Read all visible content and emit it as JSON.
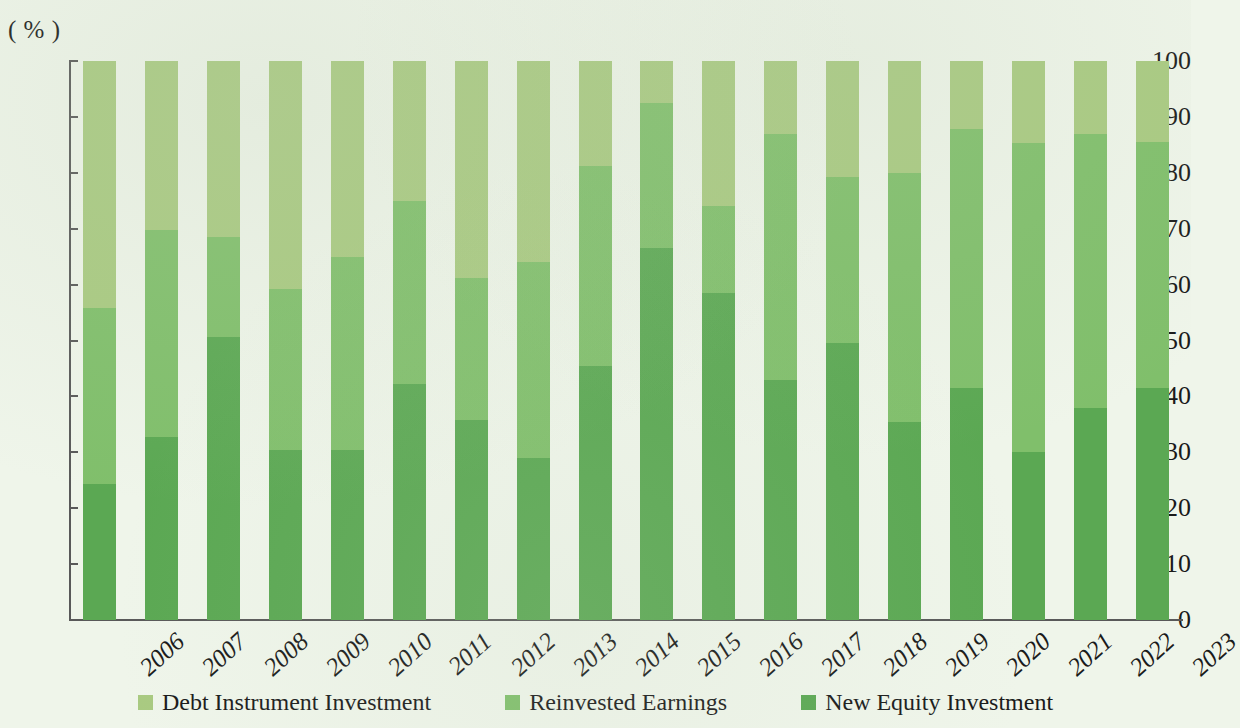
{
  "chart_data": {
    "type": "bar",
    "subtype": "100% stacked column",
    "title": "",
    "xlabel": "",
    "ylabel": "",
    "y_unit_label": "( % )",
    "ylim": [
      0,
      100
    ],
    "y_ticks": [
      0,
      10,
      20,
      30,
      40,
      50,
      60,
      70,
      80,
      90,
      100
    ],
    "grid": false,
    "legend_position": "bottom-center",
    "stack_order_bottom_to_top": [
      "New Equity Investment",
      "Reinvested Earnings",
      "Debt Instrument Investment"
    ],
    "categories": [
      "2006",
      "2007",
      "2008",
      "2009",
      "2010",
      "2011",
      "2012",
      "2013",
      "2014",
      "2015",
      "2016",
      "2017",
      "2018",
      "2019",
      "2020",
      "2021",
      "2022",
      "2023"
    ],
    "series": [
      {
        "name": "Debt Instrument Investment",
        "color": "#a9ca81",
        "values": [
          44.2,
          30.3,
          31.5,
          40.8,
          35.1,
          25.0,
          38.9,
          35.9,
          18.7,
          7.5,
          25.9,
          13.1,
          20.8,
          20.0,
          12.1,
          14.6,
          13.0,
          14.5
        ]
      },
      {
        "name": "Reinvested Earnings",
        "color": "#80bf6b",
        "values": [
          31.4,
          36.9,
          17.8,
          28.7,
          34.5,
          32.8,
          25.4,
          35.2,
          35.9,
          26.0,
          15.6,
          43.9,
          29.7,
          44.5,
          46.4,
          55.4,
          49.1,
          44.0
        ]
      },
      {
        "name": "New Equity Investment",
        "color": "#5ba853",
        "values": [
          24.4,
          32.8,
          50.7,
          30.5,
          30.4,
          42.2,
          35.7,
          28.9,
          45.4,
          66.5,
          58.5,
          43.0,
          49.5,
          35.5,
          41.5,
          30.0,
          37.9,
          41.5
        ]
      }
    ],
    "cumulative_tops": {
      "new_equity": [
        24.4,
        32.8,
        50.7,
        30.5,
        30.4,
        42.2,
        35.7,
        28.9,
        45.4,
        66.5,
        58.5,
        43.0,
        49.5,
        35.5,
        41.5,
        30.0,
        37.9,
        41.5
      ],
      "plus_reinvested": [
        55.8,
        69.7,
        68.5,
        59.2,
        64.9,
        75.0,
        61.1,
        64.1,
        81.3,
        92.5,
        74.1,
        86.9,
        79.2,
        80.0,
        87.9,
        85.4,
        87.0,
        85.5
      ],
      "total": [
        100,
        100,
        100,
        100,
        100,
        100,
        100,
        100,
        100,
        100,
        100,
        100,
        100,
        100,
        100,
        100,
        100,
        100
      ]
    }
  },
  "legend": {
    "items": [
      {
        "label": "Debt Instrument Investment",
        "color": "#a9ca81",
        "swatch_icon": "square-swatch-icon"
      },
      {
        "label": "Reinvested Earnings",
        "color": "#80bf6b",
        "swatch_icon": "square-swatch-icon"
      },
      {
        "label": "New Equity Investment",
        "color": "#5ba853",
        "swatch_icon": "square-swatch-icon"
      }
    ]
  },
  "colors": {
    "background": "#eff5ea",
    "axis": "#595959",
    "text": "#1a1a1a",
    "debt_instrument": "#a9ca81",
    "reinvested_earnings": "#80bf6b",
    "new_equity": "#5ba853"
  }
}
